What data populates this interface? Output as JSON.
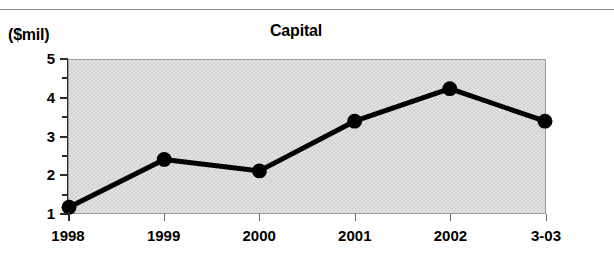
{
  "chart_data": {
    "type": "line",
    "title": "Capital",
    "xlabel": "",
    "ylabel": "($mil)",
    "categories": [
      "1998",
      "1999",
      "2000",
      "2001",
      "2002",
      "3-03"
    ],
    "values": [
      1.15,
      2.4,
      2.1,
      3.4,
      4.25,
      3.4
    ],
    "series": [
      {
        "name": "Capital",
        "values": [
          1.15,
          2.4,
          2.1,
          3.4,
          4.25,
          3.4
        ]
      }
    ],
    "ylim": [
      1,
      5
    ],
    "y_major_ticks": [
      "1",
      "2",
      "3",
      "4",
      "5"
    ],
    "y_minor_ticks": [
      1.5,
      2.5,
      3.5,
      4.5
    ],
    "grid": false,
    "legend": "none",
    "marker": "filled-circle",
    "line_color": "#000000",
    "marker_color": "#000000",
    "plot_background": "#dcdcdc"
  },
  "axis": {
    "y_unit_caption": "($mil)"
  }
}
